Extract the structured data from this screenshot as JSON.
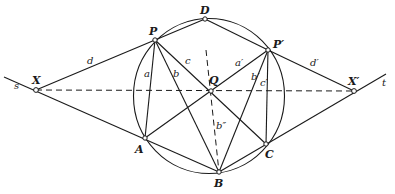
{
  "diagram": {
    "colors": {
      "stroke": "#1a1a1a",
      "point_fill": "#ffffff",
      "background": "#ffffff"
    },
    "points": {
      "P": {
        "label": "P",
        "x": 155,
        "y": 40
      },
      "D": {
        "label": "D",
        "x": 205,
        "y": 19
      },
      "P2": {
        "label": "P′",
        "x": 268,
        "y": 50
      },
      "Q": {
        "label": "Q",
        "x": 211,
        "y": 91
      },
      "A": {
        "label": "A",
        "x": 145,
        "y": 138
      },
      "B": {
        "label": "B",
        "x": 219,
        "y": 172
      },
      "C": {
        "label": "C",
        "x": 266,
        "y": 144
      },
      "X": {
        "label": "X",
        "x": 36,
        "y": 90
      },
      "X2": {
        "label": "X′",
        "x": 354,
        "y": 91
      }
    },
    "segment_labels": {
      "d": "d",
      "a": "a",
      "b": "b",
      "c": "c",
      "a2": "a′",
      "b2": "b′",
      "c2": "c′",
      "d2": "d′",
      "b3": "b″",
      "s": "s",
      "t": "t"
    }
  }
}
